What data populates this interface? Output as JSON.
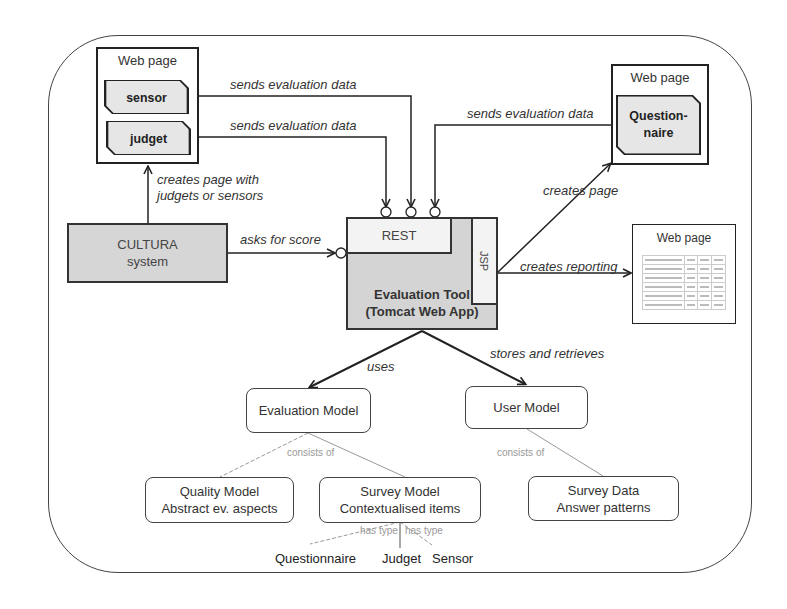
{
  "diagram": {
    "type": "architecture",
    "colors": {
      "stroke": "#222222",
      "component_fill": "#d6d6d6",
      "widget_fill": "#e6e6e6",
      "faint_label": "#999999"
    },
    "left_webpage": {
      "title": "Web page",
      "widgets": [
        {
          "label": "sensor"
        },
        {
          "label": "judget"
        }
      ]
    },
    "right_webpage": {
      "title": "Web page",
      "widget": {
        "line1": "Question-",
        "line2": "naire"
      }
    },
    "report_webpage": {
      "title": "Web page",
      "table_rows": 6,
      "table_cols": 4
    },
    "cultura": {
      "line1": "CULTURA",
      "line2": "system"
    },
    "eval_tool": {
      "rest": "REST",
      "jsp": "JSP",
      "line1": "Evaluation Tool",
      "line2": "(Tomcat Web App)"
    },
    "edges": {
      "sensor_to_tool": "sends evaluation data",
      "judget_to_tool": "sends evaluation data",
      "questionnaire_to_tool": "sends evaluation data",
      "cultura_to_webpage_line1": "creates page with",
      "cultura_to_webpage_line2": "judgets or sensors",
      "cultura_to_tool": "asks for score",
      "tool_to_questionnaire": "creates page",
      "tool_to_report": "creates reporting",
      "tool_to_eval_model": "uses",
      "tool_to_user_model": "stores and retrieves",
      "eval_model_consists": "consists of",
      "user_model_consists": "consists of",
      "has_type_left": "has type",
      "has_type_right": "has type"
    },
    "models": {
      "evaluation_model": "Evaluation Model",
      "user_model": "User Model",
      "quality_model": {
        "line1": "Quality Model",
        "line2": "Abstract ev. aspects"
      },
      "survey_model": {
        "line1": "Survey Model",
        "line2": "Contextualised items"
      },
      "survey_data": {
        "line1": "Survey Data",
        "line2": "Answer patterns"
      }
    },
    "survey_item_types": [
      "Questionnaire",
      "Judget",
      "Sensor"
    ]
  }
}
